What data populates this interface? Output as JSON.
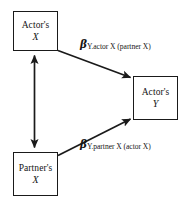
{
  "diagram": {
    "nodes": [
      {
        "id": "actor-x",
        "owner": "Actor's",
        "variable": "X"
      },
      {
        "id": "partner-x",
        "owner": "Partner's",
        "variable": "X"
      },
      {
        "id": "actor-y",
        "owner": "Actor's",
        "variable": "Y"
      }
    ],
    "labels": {
      "actor_path": {
        "symbol": "β",
        "subscript": "Y.actor X (partner X)",
        "full": "βY.actor X (partner X)"
      },
      "partner_path": {
        "symbol": "β",
        "subscript": "Y.partner X (actor X)",
        "full": "βY.partner X (actor X)"
      }
    },
    "edges": [
      {
        "name": "actor-x-to-actor-y",
        "kind": "single-headed-arrow"
      },
      {
        "name": "partner-x-to-actor-y",
        "kind": "single-headed-arrow"
      },
      {
        "name": "actor-x-partner-x-covariance",
        "kind": "double-headed-arrow"
      }
    ],
    "colors": {
      "stroke": "#1a1a1a",
      "text": "#151515",
      "background": "#ffffff"
    }
  }
}
